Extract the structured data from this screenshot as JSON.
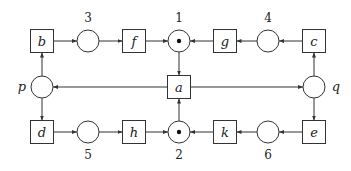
{
  "diagram": {
    "type": "petri-net",
    "transitions": [
      {
        "id": "b",
        "label": "b",
        "x": 42,
        "y": 41
      },
      {
        "id": "f",
        "label": "f",
        "x": 134,
        "y": 41
      },
      {
        "id": "g",
        "label": "g",
        "x": 225,
        "y": 41
      },
      {
        "id": "c",
        "label": "c",
        "x": 314,
        "y": 41
      },
      {
        "id": "a",
        "label": "a",
        "x": 179,
        "y": 87
      },
      {
        "id": "d",
        "label": "d",
        "x": 42,
        "y": 132
      },
      {
        "id": "h",
        "label": "h",
        "x": 134,
        "y": 132
      },
      {
        "id": "k",
        "label": "k",
        "x": 225,
        "y": 132
      },
      {
        "id": "e",
        "label": "e",
        "x": 314,
        "y": 132
      }
    ],
    "places": [
      {
        "id": "3",
        "label": "3",
        "x": 88,
        "y": 41,
        "tokens": 0,
        "label_pos": "above"
      },
      {
        "id": "1",
        "label": "1",
        "x": 179,
        "y": 41,
        "tokens": 1,
        "label_pos": "above"
      },
      {
        "id": "4",
        "label": "4",
        "x": 268,
        "y": 41,
        "tokens": 0,
        "label_pos": "above"
      },
      {
        "id": "p",
        "label": "p",
        "x": 42,
        "y": 87,
        "tokens": 0,
        "label_pos": "left"
      },
      {
        "id": "q",
        "label": "q",
        "x": 314,
        "y": 87,
        "tokens": 0,
        "label_pos": "right"
      },
      {
        "id": "5",
        "label": "5",
        "x": 88,
        "y": 132,
        "tokens": 0,
        "label_pos": "below"
      },
      {
        "id": "2",
        "label": "2",
        "x": 179,
        "y": 132,
        "tokens": 1,
        "label_pos": "below"
      },
      {
        "id": "6",
        "label": "6",
        "x": 268,
        "y": 132,
        "tokens": 0,
        "label_pos": "below"
      }
    ],
    "arcs": [
      [
        "b",
        "3"
      ],
      [
        "3",
        "f"
      ],
      [
        "f",
        "1"
      ],
      [
        "g",
        "1"
      ],
      [
        "4",
        "g"
      ],
      [
        "c",
        "4"
      ],
      [
        "1",
        "a"
      ],
      [
        "a",
        "p"
      ],
      [
        "a",
        "q"
      ],
      [
        "p",
        "b"
      ],
      [
        "p",
        "d"
      ],
      [
        "q",
        "c"
      ],
      [
        "q",
        "e"
      ],
      [
        "d",
        "5"
      ],
      [
        "5",
        "h"
      ],
      [
        "h",
        "2"
      ],
      [
        "k",
        "2"
      ],
      [
        "6",
        "k"
      ],
      [
        "e",
        "6"
      ],
      [
        "2",
        "a"
      ]
    ]
  }
}
